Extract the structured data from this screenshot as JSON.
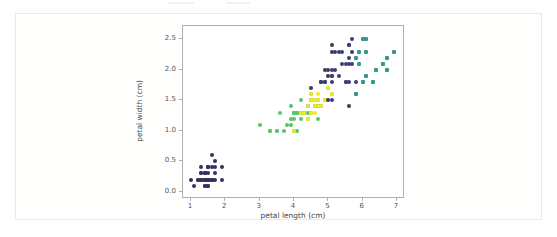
{
  "figure": {
    "background_color": "#ffffff",
    "card_border_color": "#e4f0de",
    "axes_edge_color": "#b0b0b0"
  },
  "chart_data": {
    "type": "scatter",
    "title": "",
    "xlabel": "petal length (cm)",
    "ylabel": "petal width (cm)",
    "xlim": [
      0.77,
      7.23
    ],
    "ylim": [
      -0.12,
      2.72
    ],
    "xticks": [
      1,
      2,
      3,
      4,
      5,
      6,
      7
    ],
    "xticklabels": [
      "1",
      "2",
      "3",
      "4",
      "5",
      "6",
      "7"
    ],
    "yticks": [
      0.0,
      0.5,
      1.0,
      1.5,
      2.0,
      2.5
    ],
    "yticklabels": [
      "0.0",
      "0.5",
      "1.0",
      "1.5",
      "2.0",
      "2.5"
    ],
    "grid": false,
    "legend": "none",
    "colormap": "viridis",
    "marker_size_px": 4,
    "series": [
      {
        "name": "setosa",
        "color": "#3b2e60",
        "points": [
          [
            1.4,
            0.2
          ],
          [
            1.4,
            0.2
          ],
          [
            1.3,
            0.2
          ],
          [
            1.5,
            0.2
          ],
          [
            1.4,
            0.2
          ],
          [
            1.7,
            0.4
          ],
          [
            1.4,
            0.3
          ],
          [
            1.5,
            0.2
          ],
          [
            1.4,
            0.2
          ],
          [
            1.5,
            0.1
          ],
          [
            1.5,
            0.2
          ],
          [
            1.6,
            0.2
          ],
          [
            1.4,
            0.1
          ],
          [
            1.1,
            0.1
          ],
          [
            1.2,
            0.2
          ],
          [
            1.5,
            0.4
          ],
          [
            1.3,
            0.4
          ],
          [
            1.4,
            0.3
          ],
          [
            1.7,
            0.3
          ],
          [
            1.5,
            0.3
          ],
          [
            1.7,
            0.2
          ],
          [
            1.5,
            0.4
          ],
          [
            1.0,
            0.2
          ],
          [
            1.7,
            0.5
          ],
          [
            1.9,
            0.2
          ],
          [
            1.6,
            0.2
          ],
          [
            1.6,
            0.4
          ],
          [
            1.5,
            0.2
          ],
          [
            1.4,
            0.2
          ],
          [
            1.6,
            0.2
          ],
          [
            1.6,
            0.2
          ],
          [
            1.5,
            0.4
          ],
          [
            1.5,
            0.1
          ],
          [
            1.4,
            0.2
          ],
          [
            1.5,
            0.2
          ],
          [
            1.2,
            0.2
          ],
          [
            1.3,
            0.2
          ],
          [
            1.4,
            0.1
          ],
          [
            1.3,
            0.2
          ],
          [
            1.5,
            0.2
          ],
          [
            1.3,
            0.3
          ],
          [
            1.3,
            0.3
          ],
          [
            1.3,
            0.2
          ],
          [
            1.6,
            0.6
          ],
          [
            1.9,
            0.4
          ],
          [
            1.4,
            0.3
          ],
          [
            1.6,
            0.2
          ],
          [
            1.4,
            0.2
          ],
          [
            1.5,
            0.2
          ],
          [
            1.4,
            0.2
          ]
        ]
      },
      {
        "name": "versicolor-green",
        "color": "#55c667",
        "points": [
          [
            4.7,
            1.4
          ],
          [
            4.5,
            1.5
          ],
          [
            4.9,
            1.5
          ],
          [
            4.0,
            1.3
          ],
          [
            4.6,
            1.5
          ],
          [
            4.5,
            1.3
          ],
          [
            3.3,
            1.0
          ],
          [
            4.6,
            1.4
          ],
          [
            3.9,
            1.4
          ],
          [
            3.5,
            1.0
          ],
          [
            4.2,
            1.5
          ],
          [
            4.0,
            1.0
          ],
          [
            4.7,
            1.4
          ],
          [
            3.6,
            1.3
          ],
          [
            4.4,
            1.4
          ],
          [
            4.5,
            1.5
          ],
          [
            4.1,
            1.0
          ],
          [
            4.5,
            1.5
          ],
          [
            3.9,
            1.1
          ],
          [
            4.8,
            1.8
          ],
          [
            4.0,
            1.3
          ],
          [
            4.9,
            1.5
          ],
          [
            4.7,
            1.2
          ],
          [
            4.3,
            1.3
          ],
          [
            4.4,
            1.4
          ],
          [
            4.8,
            1.4
          ],
          [
            5.0,
            1.7
          ],
          [
            4.5,
            1.5
          ],
          [
            3.5,
            1.0
          ],
          [
            3.8,
            1.1
          ],
          [
            3.7,
            1.0
          ],
          [
            3.9,
            1.2
          ],
          [
            5.1,
            1.6
          ],
          [
            4.5,
            1.5
          ],
          [
            4.5,
            1.6
          ],
          [
            4.7,
            1.5
          ],
          [
            4.4,
            1.3
          ],
          [
            4.1,
            1.3
          ],
          [
            4.0,
            1.3
          ],
          [
            4.4,
            1.2
          ],
          [
            4.6,
            1.4
          ],
          [
            4.0,
            1.2
          ],
          [
            3.3,
            1.0
          ],
          [
            4.2,
            1.3
          ],
          [
            4.2,
            1.2
          ],
          [
            4.2,
            1.3
          ],
          [
            4.3,
            1.3
          ],
          [
            3.0,
            1.1
          ],
          [
            4.1,
            1.3
          ]
        ]
      },
      {
        "name": "versicolor-yellow",
        "color": "#f6e620",
        "points": [
          [
            4.5,
            1.5
          ],
          [
            4.9,
            1.5
          ],
          [
            4.7,
            1.6
          ],
          [
            5.0,
            1.7
          ],
          [
            4.6,
            1.5
          ],
          [
            4.8,
            1.8
          ],
          [
            5.1,
            1.6
          ],
          [
            4.5,
            1.6
          ],
          [
            4.9,
            2.0
          ],
          [
            5.0,
            1.5
          ],
          [
            4.5,
            1.7
          ],
          [
            4.7,
            1.4
          ],
          [
            5.1,
            2.4
          ],
          [
            4.8,
            1.8
          ],
          [
            4.9,
            1.8
          ],
          [
            5.6,
            1.4
          ],
          [
            4.5,
            1.5
          ],
          [
            5.1,
            2.3
          ],
          [
            4.8,
            1.8
          ],
          [
            5.0,
            1.9
          ],
          [
            4.4,
            1.4
          ],
          [
            4.6,
            1.4
          ],
          [
            4.9,
            1.5
          ],
          [
            5.0,
            2.0
          ],
          [
            4.6,
            1.3
          ],
          [
            4.4,
            1.2
          ],
          [
            4.2,
            1.3
          ],
          [
            4.0,
            1.0
          ],
          [
            4.8,
            1.4
          ],
          [
            4.3,
            1.3
          ],
          [
            4.5,
            1.3
          ],
          [
            5.0,
            1.5
          ],
          [
            4.6,
            1.5
          ],
          [
            4.7,
            1.5
          ]
        ]
      },
      {
        "name": "virginica-navy",
        "color": "#3b3b77",
        "points": [
          [
            6.0,
            2.5
          ],
          [
            5.1,
            1.9
          ],
          [
            5.9,
            2.1
          ],
          [
            5.6,
            1.8
          ],
          [
            5.8,
            2.2
          ],
          [
            6.6,
            2.1
          ],
          [
            4.5,
            1.7
          ],
          [
            6.3,
            1.8
          ],
          [
            5.8,
            1.8
          ],
          [
            6.1,
            2.5
          ],
          [
            5.1,
            2.0
          ],
          [
            5.3,
            1.9
          ],
          [
            5.5,
            2.1
          ],
          [
            5.0,
            2.0
          ],
          [
            5.1,
            2.4
          ],
          [
            5.3,
            2.3
          ],
          [
            5.5,
            1.8
          ],
          [
            6.7,
            2.2
          ],
          [
            6.9,
            2.3
          ],
          [
            5.0,
            1.5
          ],
          [
            5.7,
            2.3
          ],
          [
            4.9,
            2.0
          ],
          [
            6.7,
            2.0
          ],
          [
            4.9,
            1.8
          ],
          [
            5.7,
            2.1
          ],
          [
            6.0,
            1.8
          ],
          [
            4.8,
            1.8
          ],
          [
            4.9,
            1.8
          ],
          [
            5.6,
            2.1
          ],
          [
            5.8,
            1.6
          ],
          [
            6.1,
            1.9
          ],
          [
            6.4,
            2.0
          ],
          [
            5.6,
            2.2
          ],
          [
            5.1,
            1.5
          ],
          [
            5.6,
            1.4
          ],
          [
            6.1,
            2.3
          ],
          [
            5.6,
            2.4
          ],
          [
            5.5,
            1.8
          ],
          [
            4.8,
            1.8
          ],
          [
            5.4,
            2.1
          ],
          [
            5.6,
            2.4
          ],
          [
            5.1,
            2.3
          ],
          [
            5.1,
            1.9
          ],
          [
            5.9,
            2.3
          ],
          [
            5.7,
            2.5
          ],
          [
            5.2,
            2.3
          ],
          [
            5.0,
            1.9
          ],
          [
            5.2,
            2.0
          ],
          [
            5.4,
            2.3
          ],
          [
            5.1,
            1.8
          ]
        ]
      },
      {
        "name": "virginica-teal",
        "color": "#2f9e8f",
        "points": [
          [
            6.6,
            2.1
          ],
          [
            6.3,
            1.8
          ],
          [
            6.7,
            2.2
          ],
          [
            6.9,
            2.3
          ],
          [
            6.7,
            2.0
          ],
          [
            6.0,
            1.8
          ],
          [
            6.1,
            1.9
          ],
          [
            6.4,
            2.0
          ],
          [
            5.8,
            1.6
          ],
          [
            6.1,
            2.3
          ],
          [
            5.9,
            2.3
          ],
          [
            6.0,
            2.5
          ],
          [
            5.9,
            2.1
          ],
          [
            6.3,
            1.8
          ],
          [
            5.8,
            2.2
          ],
          [
            6.1,
            2.5
          ],
          [
            6.6,
            2.1
          ],
          [
            6.4,
            2.0
          ]
        ]
      }
    ]
  }
}
